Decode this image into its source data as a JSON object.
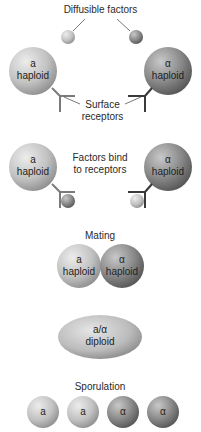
{
  "title_labels": {
    "diffusible_factors": "Diffusible factors",
    "surface_receptors_1": "Surface",
    "surface_receptors_2": "receptors",
    "factors_bind_1": "Factors bind",
    "factors_bind_2": "to receptors",
    "mating": "Mating",
    "sporulation": "Sporulation"
  },
  "cells": {
    "a_haploid_top": {
      "line1": "a",
      "line2": "haploid"
    },
    "alpha_haploid_top": {
      "line1": "α",
      "line2": "haploid"
    },
    "a_haploid_bind": {
      "line1": "a",
      "line2": "haploid"
    },
    "alpha_haploid_bind": {
      "line1": "α",
      "line2": "haploid"
    },
    "a_haploid_mating": {
      "line1": "a",
      "line2": "haploid"
    },
    "alpha_haploid_mating": {
      "line1": "α",
      "line2": "haploid"
    },
    "diploid": {
      "line1": "a/α",
      "line2": "diploid"
    }
  },
  "spores": [
    {
      "label": "a"
    },
    {
      "label": "a"
    },
    {
      "label": "α"
    },
    {
      "label": "α"
    }
  ],
  "colors": {
    "a_cell": "#bdbdbd",
    "alpha_cell": "#8a8a8a",
    "receptor_a": "#7a7a7a",
    "receptor_alpha": "#3a3a3a"
  }
}
